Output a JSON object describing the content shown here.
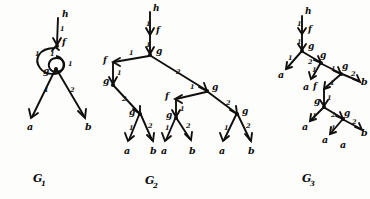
{
  "figure": {
    "background_color": "#fdfdfc",
    "ink_color": "#100f0d",
    "style": "hand-drawn pen sketch"
  },
  "captions": [
    {
      "base": "G",
      "subscript": "1"
    },
    {
      "base": "G",
      "subscript": "2"
    },
    {
      "base": "G",
      "subscript": "3"
    }
  ],
  "graphs": [
    {
      "id": "G1",
      "caption": "G1",
      "description": "cyclic term graph with a self loop",
      "nodes": [
        {
          "id": "g1-h",
          "label": "h",
          "kind": "root-symbol"
        },
        {
          "id": "g1-f",
          "label": "f",
          "kind": "function-symbol"
        },
        {
          "id": "g1-g",
          "label": "g",
          "kind": "function-symbol"
        },
        {
          "id": "g1-a",
          "label": "a",
          "kind": "leaf"
        },
        {
          "id": "g1-b",
          "label": "b",
          "kind": "leaf"
        }
      ],
      "edges": [
        {
          "from": "g1-h",
          "to": "g1-f",
          "label": "1"
        },
        {
          "from": "g1-f",
          "to": "g1-f",
          "label": "1",
          "kind": "self-loop"
        },
        {
          "from": "g1-f",
          "to": "g1-g",
          "label": "1"
        },
        {
          "from": "g1-g",
          "to": "g1-a",
          "label": "1"
        },
        {
          "from": "g1-f",
          "to": "g1-b",
          "label": "2"
        }
      ]
    },
    {
      "id": "G2",
      "caption": "G2",
      "description": "binary tree unfolding with six leaves",
      "nodes": [
        {
          "id": "g2-h",
          "label": "h",
          "kind": "root-symbol"
        },
        {
          "id": "g2-f0",
          "label": "f",
          "kind": "function-symbol"
        },
        {
          "id": "g2-g0",
          "label": "g",
          "kind": "function-symbol"
        },
        {
          "id": "g2-f1",
          "label": "f",
          "kind": "function-symbol"
        },
        {
          "id": "g2-g1",
          "label": "g",
          "kind": "function-symbol"
        },
        {
          "id": "g2-g2",
          "label": "g",
          "kind": "function-symbol"
        },
        {
          "id": "g2-f2",
          "label": "f",
          "kind": "function-symbol"
        },
        {
          "id": "g2-g3",
          "label": "g",
          "kind": "function-symbol"
        },
        {
          "id": "g2-g4",
          "label": "g",
          "kind": "function-symbol"
        },
        {
          "id": "g2-a1",
          "label": "a",
          "kind": "leaf"
        },
        {
          "id": "g2-b1",
          "label": "b",
          "kind": "leaf"
        },
        {
          "id": "g2-a2",
          "label": "a",
          "kind": "leaf"
        },
        {
          "id": "g2-b2",
          "label": "b",
          "kind": "leaf"
        },
        {
          "id": "g2-a3",
          "label": "a",
          "kind": "leaf"
        },
        {
          "id": "g2-b3",
          "label": "b",
          "kind": "leaf"
        }
      ],
      "edges": [
        {
          "from": "g2-h",
          "to": "g2-f0",
          "label": "1"
        },
        {
          "from": "g2-f0",
          "to": "g2-g0",
          "label": "1"
        },
        {
          "from": "g2-g0",
          "to": "g2-f1",
          "label": "1"
        },
        {
          "from": "g2-g0",
          "to": "g2-g2",
          "label": "2"
        },
        {
          "from": "g2-f1",
          "to": "g2-g1",
          "label": "1"
        },
        {
          "from": "g2-g1",
          "to": "g2-g3",
          "label": "2"
        },
        {
          "from": "g2-g3",
          "to": "g2-a1",
          "label": "1"
        },
        {
          "from": "g2-g3",
          "to": "g2-b1",
          "label": "2"
        },
        {
          "from": "g2-g2",
          "to": "g2-f2",
          "label": "1"
        },
        {
          "from": "g2-f2",
          "to": "g2-g5",
          "label": "1"
        },
        {
          "from": "g2-g5",
          "to": "g2-a2",
          "label": "1"
        },
        {
          "from": "g2-g5",
          "to": "g2-b2",
          "label": "2"
        },
        {
          "from": "g2-g2",
          "to": "g2-g4",
          "label": "2"
        },
        {
          "from": "g2-g4",
          "to": "g2-a3",
          "label": "1"
        },
        {
          "from": "g2-g4",
          "to": "g2-b3",
          "label": "2"
        }
      ]
    },
    {
      "id": "G3",
      "caption": "G3",
      "description": "diagonally drawn tree unfolding",
      "nodes": [
        {
          "id": "g3-h",
          "label": "h",
          "kind": "root-symbol"
        },
        {
          "id": "g3-f0",
          "label": "f",
          "kind": "function-symbol"
        },
        {
          "id": "g3-g0",
          "label": "g",
          "kind": "function-symbol"
        },
        {
          "id": "g3-g1",
          "label": "g",
          "kind": "function-symbol"
        },
        {
          "id": "g3-g2",
          "label": "g",
          "kind": "function-symbol"
        },
        {
          "id": "g3-f1",
          "label": "f",
          "kind": "function-symbol"
        },
        {
          "id": "g3-g3",
          "label": "g",
          "kind": "function-symbol"
        },
        {
          "id": "g3-g4",
          "label": "g",
          "kind": "function-symbol"
        },
        {
          "id": "g3-g5",
          "label": "g",
          "kind": "function-symbol"
        },
        {
          "id": "g3-a1",
          "label": "a",
          "kind": "leaf"
        },
        {
          "id": "g3-a2",
          "label": "a",
          "kind": "leaf"
        },
        {
          "id": "g3-b1",
          "label": "b",
          "kind": "leaf"
        },
        {
          "id": "g3-a3",
          "label": "a",
          "kind": "leaf"
        },
        {
          "id": "g3-a4",
          "label": "a",
          "kind": "leaf"
        },
        {
          "id": "g3-a5",
          "label": "a",
          "kind": "leaf"
        },
        {
          "id": "g3-b2",
          "label": "b",
          "kind": "leaf"
        }
      ],
      "edges": [
        {
          "from": "g3-h",
          "to": "g3-f0",
          "label": "1"
        },
        {
          "from": "g3-f0",
          "to": "g3-g0",
          "label": "1"
        },
        {
          "from": "g3-g0",
          "to": "g3-a1",
          "label": "1"
        },
        {
          "from": "g3-g0",
          "to": "g3-g1",
          "label": "2"
        },
        {
          "from": "g3-g1",
          "to": "g3-a2",
          "label": "1"
        },
        {
          "from": "g3-g1",
          "to": "g3-g2",
          "label": "1"
        },
        {
          "from": "g3-g2",
          "to": "g3-b1",
          "label": "2"
        },
        {
          "from": "g3-g2",
          "to": "g3-f1",
          "label": "1"
        },
        {
          "from": "g3-f1",
          "to": "g3-g3",
          "label": "1"
        },
        {
          "from": "g3-g3",
          "to": "g3-a3",
          "label": "1"
        },
        {
          "from": "g3-g3",
          "to": "g3-g4",
          "label": "2"
        },
        {
          "from": "g3-g4",
          "to": "g3-a4",
          "label": "1"
        },
        {
          "from": "g3-g4",
          "to": "g3-g5",
          "label": "2"
        },
        {
          "from": "g3-g5",
          "to": "g3-a5",
          "label": "1"
        },
        {
          "from": "g3-g5",
          "to": "g3-b2",
          "label": "2"
        }
      ]
    }
  ],
  "labels": {
    "g1": {
      "h": "h",
      "f": "f",
      "g": "g",
      "a": "a",
      "b": "b",
      "e_h_f": "1",
      "e_loop": "1",
      "e_f_g": "1",
      "e_g_a": "1",
      "e_f_b": "2"
    },
    "g2": {
      "h": "h",
      "f_top": "f",
      "g_top": "g",
      "f_left": "f",
      "g_left": "g",
      "g_mid": "g",
      "f_mid": "f",
      "g_l_leafparent": "g",
      "g_m_leafparent": "g",
      "g_r_leafparent": "g",
      "a1": "a",
      "b1": "b",
      "a2": "a",
      "b2": "b",
      "a3": "a",
      "b3": "b",
      "one": "1",
      "two": "2"
    },
    "g3": {
      "h": "h",
      "f_top": "f",
      "g_top": "g",
      "g_2": "g",
      "g_3": "g",
      "f_mid": "f",
      "g_4": "g",
      "g_5": "g",
      "g_6": "g",
      "a1": "a",
      "a2": "a",
      "b1": "b",
      "a3": "a",
      "a4": "a",
      "a5": "a",
      "b2": "b",
      "one": "1",
      "two": "2"
    }
  }
}
